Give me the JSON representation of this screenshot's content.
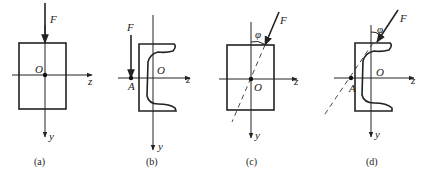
{
  "figure": {
    "panels": [
      {
        "id": "a",
        "caption": "(a)",
        "force_label": "F",
        "origin_label": "O",
        "z_label": "z",
        "y_label": "y",
        "shape": "rectangle",
        "load": "axial at centroid O"
      },
      {
        "id": "b",
        "caption": "(b)",
        "force_label": "F",
        "origin_label": "O",
        "point_label": "A",
        "z_label": "z",
        "y_label": "y",
        "shape": "channel",
        "load": "vertical at point A"
      },
      {
        "id": "c",
        "caption": "(c)",
        "force_label": "F",
        "origin_label": "O",
        "angle_label": "φ",
        "z_label": "z",
        "y_label": "y",
        "shape": "rectangle",
        "load": "inclined at angle φ through O"
      },
      {
        "id": "d",
        "caption": "(d)",
        "force_label": "F",
        "origin_label": "O",
        "point_label": "A",
        "angle_label": "φ",
        "z_label": "z",
        "y_label": "y",
        "shape": "channel",
        "load": "inclined at angle φ through A"
      }
    ]
  }
}
